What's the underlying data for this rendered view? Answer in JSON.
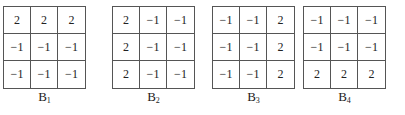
{
  "kernels": [
    {
      "name": "B",
      "subscript": "1",
      "left": 3,
      "cells": [
        [
          "2",
          "2",
          "2"
        ],
        [
          "−1",
          "−1",
          "−1"
        ],
        [
          "−1",
          "−1",
          "−1"
        ]
      ]
    },
    {
      "name": "B",
      "subscript": "2",
      "left": 112,
      "cells": [
        [
          "2",
          "−1",
          "−1"
        ],
        [
          "2",
          "−1",
          "−1"
        ],
        [
          "2",
          "−1",
          "−1"
        ]
      ]
    },
    {
      "name": "B",
      "subscript": "3",
      "left": 212,
      "cells": [
        [
          "−1",
          "−1",
          "2"
        ],
        [
          "−1",
          "−1",
          "2"
        ],
        [
          "−1",
          "−1",
          "2"
        ]
      ]
    },
    {
      "name": "B",
      "subscript": "4",
      "left": 303,
      "cells": [
        [
          "−1",
          "−1",
          "−1"
        ],
        [
          "−1",
          "−1",
          "−1"
        ],
        [
          "2",
          "2",
          "2"
        ]
      ]
    }
  ]
}
